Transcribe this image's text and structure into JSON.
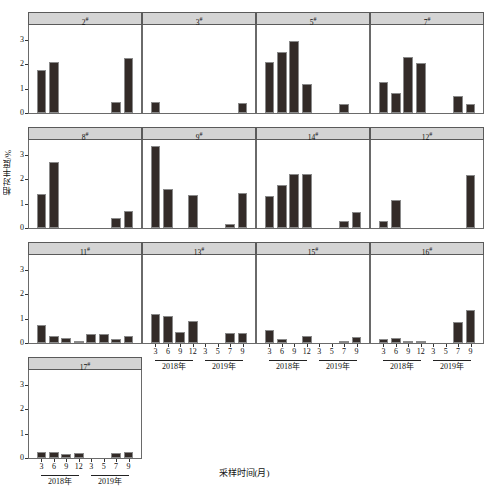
{
  "figure": {
    "ylabel": "相对丰度/%",
    "xlabel": "采样时间(月)",
    "year_groups": [
      {
        "label": "2018年",
        "months": [
          "3",
          "6",
          "9",
          "12"
        ]
      },
      {
        "label": "2019年",
        "months": [
          "3",
          "5",
          "7",
          "9"
        ]
      }
    ],
    "y_ticks": [
      "0",
      "1",
      "2",
      "3"
    ],
    "bar_color": "#332b28",
    "strip_color": "#d4d4d4"
  },
  "chart_data": {
    "type": "bar",
    "title": "",
    "xlabel": "采样时间(月)",
    "ylabel": "相对丰度/%",
    "ylim": [
      0,
      3.6
    ],
    "yticks": [
      0,
      1,
      2,
      3
    ],
    "grid": false,
    "legend": "none",
    "categories": [
      "3",
      "6",
      "9",
      "12",
      "3",
      "5",
      "7",
      "9"
    ],
    "category_groups": [
      "2018年",
      "2018年",
      "2018年",
      "2018年",
      "2019年",
      "2019年",
      "2019年",
      "2019年"
    ],
    "panel_layout": {
      "rows": 4,
      "cols": 4,
      "panels_in_last_row": 1
    },
    "panels": [
      {
        "name": "2#",
        "values": [
          1.75,
          2.1,
          0,
          0,
          0,
          0,
          0.45,
          2.25
        ]
      },
      {
        "name": "3#",
        "values": [
          0.45,
          0,
          0,
          0,
          0,
          0,
          0,
          0.4
        ]
      },
      {
        "name": "5#",
        "values": [
          2.1,
          2.5,
          2.95,
          1.2,
          0,
          0,
          0.35,
          0
        ]
      },
      {
        "name": "7#",
        "values": [
          1.25,
          0.8,
          2.3,
          2.05,
          0,
          0,
          0.7,
          0.35
        ]
      },
      {
        "name": "8#",
        "values": [
          1.4,
          2.7,
          0,
          0,
          0,
          0,
          0.4,
          0.7
        ]
      },
      {
        "name": "9#",
        "values": [
          3.35,
          1.6,
          0,
          1.35,
          0,
          0,
          0.15,
          1.45
        ]
      },
      {
        "name": "14#",
        "values": [
          1.3,
          1.75,
          2.2,
          2.2,
          0,
          0,
          0.3,
          0.65
        ]
      },
      {
        "name": "12#",
        "values": [
          0.3,
          1.15,
          0,
          0,
          0,
          0,
          0,
          2.15
        ]
      },
      {
        "name": "11#",
        "values": [
          0.72,
          0.3,
          0.22,
          0.07,
          0.38,
          0.35,
          0.15,
          0.3
        ]
      },
      {
        "name": "13#",
        "values": [
          1.2,
          1.1,
          0.45,
          0.9,
          0,
          0,
          0.4,
          0.42
        ]
      },
      {
        "name": "15#",
        "values": [
          0.55,
          0.17,
          0,
          0.3,
          0,
          0,
          0.05,
          0.25
        ]
      },
      {
        "name": "16#",
        "values": [
          0.17,
          0.22,
          0.08,
          0.08,
          0,
          0,
          0.85,
          1.35
        ]
      },
      {
        "name": "17#",
        "values": [
          0.25,
          0.25,
          0.17,
          0.2,
          0,
          0,
          0.2,
          0.25
        ]
      }
    ]
  }
}
